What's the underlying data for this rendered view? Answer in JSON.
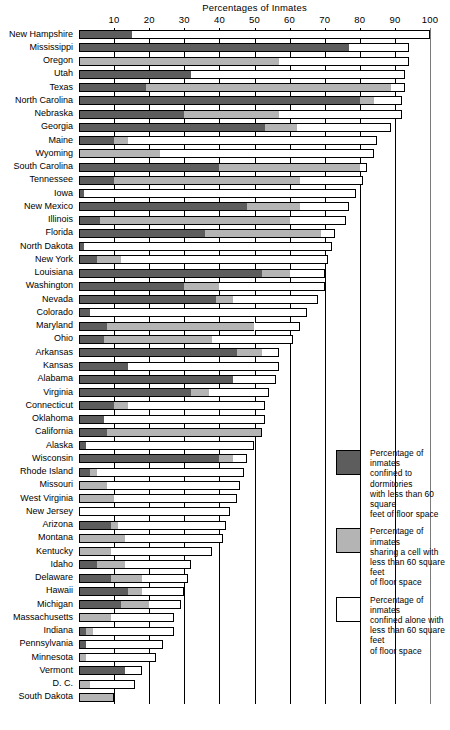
{
  "chart_data": {
    "type": "bar",
    "orientation": "horizontal",
    "stacked": true,
    "title": "Percentages of Inmates",
    "xlabel": "",
    "ylabel": "",
    "xlim": [
      0,
      100
    ],
    "xticks": [
      10,
      20,
      30,
      40,
      50,
      60,
      70,
      80,
      90,
      100
    ],
    "grid": true,
    "legend_position": "right",
    "colors": {
      "dormitories": "#5d5d5d",
      "shared_cell": "#b4b4b4",
      "alone": "#ffffff"
    },
    "series": [
      {
        "name": "Percentage of inmates confined to dormitories with less than 60 square feet of floor space",
        "key": "dormitories"
      },
      {
        "name": "Percentage of inmates sharing a cell with less than 60 square feet of floor space",
        "key": "shared_cell"
      },
      {
        "name": "Percentage of inmates confined alone with less than 60 square feet of floor space",
        "key": "alone"
      }
    ],
    "categories": [
      "New Hampshire",
      "Mississippi",
      "Oregon",
      "Utah",
      "Texas",
      "North Carolina",
      "Nebraska",
      "Georgia",
      "Maine",
      "Wyoming",
      "South Carolina",
      "Tennessee",
      "Iowa",
      "New Mexico",
      "Illinois",
      "Florida",
      "North Dakota",
      "New York",
      "Louisiana",
      "Washington",
      "Nevada",
      "Colorado",
      "Maryland",
      "Ohio",
      "Arkansas",
      "Kansas",
      "Alabama",
      "Virginia",
      "Connecticut",
      "Oklahoma",
      "California",
      "Alaska",
      "Wisconsin",
      "Rhode Island",
      "Missouri",
      "West Virginia",
      "New Jersey",
      "Arizona",
      "Montana",
      "Kentucky",
      "Idaho",
      "Delaware",
      "Hawaii",
      "Michigan",
      "Massachusetts",
      "Indiana",
      "Pennsylvania",
      "Minnesota",
      "Vermont",
      "D. C.",
      "South Dakota"
    ],
    "rows": [
      {
        "state": "New Hampshire",
        "dormitories": 15.0,
        "shared_cell": 0.0,
        "alone": 85.0,
        "total": 100.0
      },
      {
        "state": "Mississippi",
        "dormitories": 77.0,
        "shared_cell": 0.0,
        "alone": 17.0,
        "total": 94.0
      },
      {
        "state": "Oregon",
        "dormitories": 0.0,
        "shared_cell": 57.0,
        "alone": 37.0,
        "total": 94.0
      },
      {
        "state": "Utah",
        "dormitories": 32.0,
        "shared_cell": 0.0,
        "alone": 61.0,
        "total": 93.0
      },
      {
        "state": "Texas",
        "dormitories": 19.0,
        "shared_cell": 70.0,
        "alone": 4.0,
        "total": 93.0
      },
      {
        "state": "North Carolina",
        "dormitories": 80.0,
        "shared_cell": 4.0,
        "alone": 8.0,
        "total": 92.0
      },
      {
        "state": "Nebraska",
        "dormitories": 30.0,
        "shared_cell": 27.0,
        "alone": 35.0,
        "total": 92.0
      },
      {
        "state": "Georgia",
        "dormitories": 53.0,
        "shared_cell": 9.0,
        "alone": 27.0,
        "total": 89.0
      },
      {
        "state": "Maine",
        "dormitories": 10.0,
        "shared_cell": 4.0,
        "alone": 71.0,
        "total": 85.0
      },
      {
        "state": "Wyoming",
        "dormitories": 0.0,
        "shared_cell": 23.0,
        "alone": 61.0,
        "total": 84.0
      },
      {
        "state": "South Carolina",
        "dormitories": 40.0,
        "shared_cell": 40.0,
        "alone": 2.0,
        "total": 82.0
      },
      {
        "state": "Tennessee",
        "dormitories": 10.0,
        "shared_cell": 53.0,
        "alone": 18.0,
        "total": 81.0
      },
      {
        "state": "Iowa",
        "dormitories": 1.5,
        "shared_cell": 0.0,
        "alone": 77.5,
        "total": 79.0
      },
      {
        "state": "New Mexico",
        "dormitories": 48.0,
        "shared_cell": 15.0,
        "alone": 14.0,
        "total": 77.0
      },
      {
        "state": "Illinois",
        "dormitories": 6.0,
        "shared_cell": 54.0,
        "alone": 16.0,
        "total": 76.0
      },
      {
        "state": "Florida",
        "dormitories": 36.0,
        "shared_cell": 33.0,
        "alone": 4.0,
        "total": 73.0
      },
      {
        "state": "North Dakota",
        "dormitories": 1.5,
        "shared_cell": 0.0,
        "alone": 70.5,
        "total": 72.0
      },
      {
        "state": "New York",
        "dormitories": 5.0,
        "shared_cell": 7.0,
        "alone": 59.0,
        "total": 71.0
      },
      {
        "state": "Louisiana",
        "dormitories": 52.0,
        "shared_cell": 8.0,
        "alone": 10.0,
        "total": 70.0
      },
      {
        "state": "Washington",
        "dormitories": 30.0,
        "shared_cell": 10.0,
        "alone": 30.0,
        "total": 70.0
      },
      {
        "state": "Nevada",
        "dormitories": 39.0,
        "shared_cell": 5.0,
        "alone": 24.0,
        "total": 68.0
      },
      {
        "state": "Colorado",
        "dormitories": 3.0,
        "shared_cell": 0.0,
        "alone": 62.0,
        "total": 65.0
      },
      {
        "state": "Maryland",
        "dormitories": 8.0,
        "shared_cell": 42.0,
        "alone": 13.0,
        "total": 63.0
      },
      {
        "state": "Ohio",
        "dormitories": 7.0,
        "shared_cell": 31.0,
        "alone": 23.0,
        "total": 61.0
      },
      {
        "state": "Arkansas",
        "dormitories": 45.0,
        "shared_cell": 7.0,
        "alone": 5.0,
        "total": 57.0
      },
      {
        "state": "Kansas",
        "dormitories": 14.0,
        "shared_cell": 0.0,
        "alone": 43.0,
        "total": 57.0
      },
      {
        "state": "Alabama",
        "dormitories": 44.0,
        "shared_cell": 0.0,
        "alone": 12.0,
        "total": 56.0
      },
      {
        "state": "Virginia",
        "dormitories": 32.0,
        "shared_cell": 5.0,
        "alone": 17.0,
        "total": 54.0
      },
      {
        "state": "Connecticut",
        "dormitories": 10.0,
        "shared_cell": 4.0,
        "alone": 39.0,
        "total": 53.0
      },
      {
        "state": "Oklahoma",
        "dormitories": 7.0,
        "shared_cell": 0.0,
        "alone": 46.0,
        "total": 53.0
      },
      {
        "state": "California",
        "dormitories": 8.0,
        "shared_cell": 44.0,
        "alone": 0.0,
        "total": 52.0
      },
      {
        "state": "Alaska",
        "dormitories": 2.0,
        "shared_cell": 0.0,
        "alone": 48.0,
        "total": 50.0
      },
      {
        "state": "Wisconsin",
        "dormitories": 40.0,
        "shared_cell": 4.0,
        "alone": 4.0,
        "total": 48.0
      },
      {
        "state": "Rhode Island",
        "dormitories": 3.0,
        "shared_cell": 2.0,
        "alone": 42.0,
        "total": 47.0
      },
      {
        "state": "Missouri",
        "dormitories": 0.0,
        "shared_cell": 8.0,
        "alone": 38.0,
        "total": 46.0
      },
      {
        "state": "West Virginia",
        "dormitories": 0.0,
        "shared_cell": 10.0,
        "alone": 35.0,
        "total": 45.0
      },
      {
        "state": "New Jersey",
        "dormitories": 0.0,
        "shared_cell": 0.0,
        "alone": 43.0,
        "total": 43.0
      },
      {
        "state": "Arizona",
        "dormitories": 9.0,
        "shared_cell": 2.0,
        "alone": 31.0,
        "total": 42.0
      },
      {
        "state": "Montana",
        "dormitories": 0.0,
        "shared_cell": 13.0,
        "alone": 28.0,
        "total": 41.0
      },
      {
        "state": "Kentucky",
        "dormitories": 0.0,
        "shared_cell": 9.0,
        "alone": 29.0,
        "total": 38.0
      },
      {
        "state": "Idaho",
        "dormitories": 5.0,
        "shared_cell": 8.0,
        "alone": 19.0,
        "total": 32.0
      },
      {
        "state": "Delaware",
        "dormitories": 9.0,
        "shared_cell": 9.0,
        "alone": 13.0,
        "total": 31.0
      },
      {
        "state": "Hawaii",
        "dormitories": 14.0,
        "shared_cell": 4.0,
        "alone": 12.0,
        "total": 30.0
      },
      {
        "state": "Michigan",
        "dormitories": 12.0,
        "shared_cell": 8.0,
        "alone": 9.0,
        "total": 29.0
      },
      {
        "state": "Massachusetts",
        "dormitories": 0.0,
        "shared_cell": 9.0,
        "alone": 18.0,
        "total": 27.0
      },
      {
        "state": "Indiana",
        "dormitories": 2.0,
        "shared_cell": 2.0,
        "alone": 23.0,
        "total": 27.0
      },
      {
        "state": "Pennsylvania",
        "dormitories": 2.0,
        "shared_cell": 0.0,
        "alone": 22.0,
        "total": 24.0
      },
      {
        "state": "Minnesota",
        "dormitories": 0.0,
        "shared_cell": 2.0,
        "alone": 20.0,
        "total": 22.0
      },
      {
        "state": "Vermont",
        "dormitories": 13.0,
        "shared_cell": 0.0,
        "alone": 5.0,
        "total": 18.0
      },
      {
        "state": "D. C.",
        "dormitories": 0.0,
        "shared_cell": 3.0,
        "alone": 13.0,
        "total": 16.0
      },
      {
        "state": "South Dakota",
        "dormitories": 0.0,
        "shared_cell": 10.0,
        "alone": 0.0,
        "total": 10.0
      }
    ]
  },
  "legend": {
    "items": [
      {
        "key": "dormitories",
        "lines": [
          "Percentage of inmates",
          "confined to dormitories",
          "with less than 60 square",
          "feet of floor space"
        ]
      },
      {
        "key": "shared_cell",
        "lines": [
          "Percentage of inmates",
          "sharing a cell with",
          "less than 60 square feet",
          "of floor space"
        ]
      },
      {
        "key": "alone",
        "lines": [
          "Percentage of inmates",
          "confined alone with",
          "less than 60 square feet",
          "of floor space"
        ]
      }
    ]
  }
}
